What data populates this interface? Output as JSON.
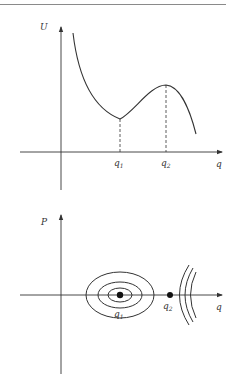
{
  "diagram": {
    "colors": {
      "line": "#333333",
      "background": "#ffffff",
      "rule": "#8a8a8a"
    },
    "potential_plot": {
      "y_axis_label": "U",
      "x_axis_label": "q",
      "ticks": [
        {
          "label": "q",
          "sub": "1"
        },
        {
          "label": "q",
          "sub": "2"
        }
      ],
      "description": "Potential energy curve with local minimum at q1 and local maximum at q2"
    },
    "phase_plot": {
      "y_axis_label": "P",
      "x_axis_label": "q",
      "points": [
        {
          "label": "q",
          "sub": "1",
          "type": "center (stable)"
        },
        {
          "label": "q",
          "sub": "2",
          "type": "saddle (unstable)"
        }
      ],
      "description": "Phase portrait: nested ellipses around q1, hyperbolic trajectories beyond q2"
    }
  }
}
